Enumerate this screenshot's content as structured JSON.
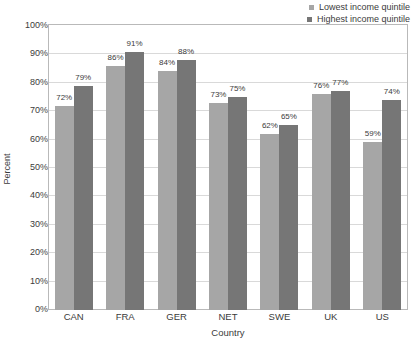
{
  "chart_data": {
    "type": "bar",
    "title": "",
    "xlabel": "Country",
    "ylabel": "Percent",
    "categories": [
      "CAN",
      "FRA",
      "GER",
      "NET",
      "SWE",
      "UK",
      "US"
    ],
    "series": [
      {
        "name": "Lowest income quintile",
        "color": "#a6a6a6",
        "values": [
          72,
          86,
          84,
          73,
          62,
          76,
          59
        ],
        "labels": [
          "72%",
          "86%",
          "84%",
          "73%",
          "62%",
          "76%",
          "59%"
        ]
      },
      {
        "name": "Highest income quintile",
        "color": "#767676",
        "values": [
          79,
          91,
          88,
          75,
          65,
          77,
          74
        ],
        "labels": [
          "79%",
          "91%",
          "88%",
          "75%",
          "65%",
          "77%",
          "74%"
        ]
      }
    ],
    "ylim": [
      0,
      100
    ],
    "yticks": [
      0,
      10,
      20,
      30,
      40,
      50,
      60,
      70,
      80,
      90,
      100
    ],
    "ytick_labels": [
      "0%",
      "10%",
      "20%",
      "30%",
      "40%",
      "50%",
      "60%",
      "70%",
      "80%",
      "90%",
      "100%"
    ],
    "grid": true,
    "legend_position": "top-right"
  },
  "legend": {
    "items": [
      {
        "label": "Lowest income quintile",
        "color": "#a6a6a6"
      },
      {
        "label": "Highest income quintile",
        "color": "#767676"
      }
    ]
  }
}
